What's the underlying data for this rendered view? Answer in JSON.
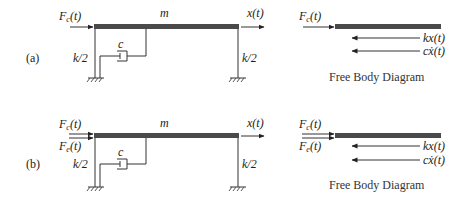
{
  "figure": {
    "panels": [
      {
        "id": "a",
        "label": "(a)",
        "mass_label": "m",
        "forces": [
          {
            "symbol": "F",
            "sub": "c",
            "arg": "(t)"
          }
        ],
        "displacement_label": "x(t)",
        "spring_left_label": "k/2",
        "spring_right_label": "k/2",
        "damper_label": "c",
        "fbd": {
          "applied_forces": [
            {
              "symbol": "F",
              "sub": "c",
              "arg": "(t)"
            }
          ],
          "reaction_forces": [
            "kx(t)",
            "cẋ(t)"
          ],
          "caption": "Free Body Diagram"
        }
      },
      {
        "id": "b",
        "label": "(b)",
        "mass_label": "m",
        "forces": [
          {
            "symbol": "F",
            "sub": "c",
            "arg": "(t)"
          },
          {
            "symbol": "F",
            "sub": "e",
            "arg": "(t)"
          }
        ],
        "displacement_label": "x(t)",
        "spring_left_label": "k/2",
        "spring_right_label": "k/2",
        "damper_label": "c",
        "fbd": {
          "applied_forces": [
            {
              "symbol": "F",
              "sub": "c",
              "arg": "(t)"
            },
            {
              "symbol": "F",
              "sub": "e",
              "arg": "(t)"
            }
          ],
          "reaction_forces": [
            "kx(t)",
            "cẋ(t)"
          ],
          "caption": "Free Body Diagram"
        }
      }
    ],
    "colors": {
      "beam": "#4a4a4a",
      "line": "#333333",
      "background": "#ffffff"
    }
  }
}
